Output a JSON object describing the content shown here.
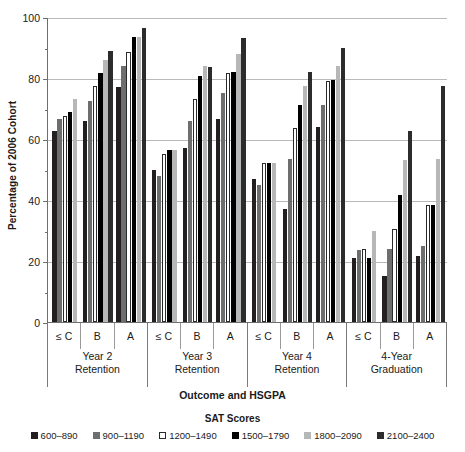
{
  "chart_data": {
    "type": "bar",
    "title": "",
    "xlabel": "Outcome and HSGPA",
    "ylabel": "Percentage of 2006 Cohort",
    "ylim": [
      0,
      100
    ],
    "yticks": [
      0,
      20,
      40,
      60,
      80,
      100
    ],
    "grid": true,
    "legend_title": "SAT Scores",
    "legend_position": "bottom",
    "group_levels": {
      "outcomes": [
        "Year 2\nRetention",
        "Year 3\nRetention",
        "Year 4\nRetention",
        "4-Year\nGraduation"
      ],
      "hsgpa": [
        "≤ C",
        "B",
        "A"
      ]
    },
    "outcomes": [
      {
        "label_line1": "Year 2",
        "label_line2": "Retention"
      },
      {
        "label_line1": "Year 3",
        "label_line2": "Retention"
      },
      {
        "label_line1": "Year 4",
        "label_line2": "Retention"
      },
      {
        "label_line1": "4-Year",
        "label_line2": "Graduation"
      }
    ],
    "series": [
      {
        "name": "600–890",
        "color": "#231f20"
      },
      {
        "name": "900–1190",
        "color": "#6d6e70"
      },
      {
        "name": "1200–1490",
        "color": "#ffffff"
      },
      {
        "name": "1500–1790",
        "color": "#000000"
      },
      {
        "name": "1800–2090",
        "color": "#b6b7b9"
      },
      {
        "name": "2100–2400",
        "color": "#2c2c2c"
      }
    ],
    "categories": [
      "Year 2 Retention ≤ C",
      "Year 2 Retention B",
      "Year 2 Retention A",
      "Year 3 Retention ≤ C",
      "Year 3 Retention B",
      "Year 3 Retention A",
      "Year 4 Retention ≤ C",
      "Year 4 Retention B",
      "Year 4 Retention A",
      "4-Year Graduation ≤ C",
      "4-Year Graduation B",
      "4-Year Graduation A"
    ],
    "groups": [
      {
        "outcome": "Year 2 Retention",
        "hsgpa": "≤ C",
        "values": [
          62.5,
          66.5,
          67.5,
          69,
          73,
          null
        ]
      },
      {
        "outcome": "Year 2 Retention",
        "hsgpa": "B",
        "values": [
          66,
          72.5,
          77.5,
          81.5,
          86,
          89
        ]
      },
      {
        "outcome": "Year 2 Retention",
        "hsgpa": "A",
        "values": [
          77,
          84,
          88.5,
          93.5,
          93.5,
          96.5
        ]
      },
      {
        "outcome": "Year 3 Retention",
        "hsgpa": "≤ C",
        "values": [
          50,
          48,
          55,
          56.5,
          56.5,
          null
        ]
      },
      {
        "outcome": "Year 3 Retention",
        "hsgpa": "B",
        "values": [
          57,
          66,
          73,
          80.5,
          84,
          83.5
        ]
      },
      {
        "outcome": "Year 3 Retention",
        "hsgpa": "A",
        "values": [
          66.5,
          75,
          81.5,
          82,
          88,
          93
        ]
      },
      {
        "outcome": "Year 4 Retention",
        "hsgpa": "≤ C",
        "values": [
          47,
          45,
          52,
          52,
          52,
          null
        ]
      },
      {
        "outcome": "Year 4 Retention",
        "hsgpa": "B",
        "values": [
          37,
          53.5,
          63.5,
          71,
          77.5,
          82
        ]
      },
      {
        "outcome": "Year 4 Retention",
        "hsgpa": "A",
        "values": [
          64,
          71,
          79,
          79.5,
          84,
          90
        ]
      },
      {
        "outcome": "4-Year Graduation",
        "hsgpa": "≤ C",
        "values": [
          21,
          23.5,
          24,
          21,
          30,
          null
        ]
      },
      {
        "outcome": "4-Year Graduation",
        "hsgpa": "B",
        "values": [
          15,
          24,
          30.5,
          41.5,
          53,
          62.5
        ]
      },
      {
        "outcome": "4-Year Graduation",
        "hsgpa": "A",
        "values": [
          21.5,
          25,
          38.5,
          38.5,
          53.5,
          77.5
        ]
      }
    ]
  }
}
